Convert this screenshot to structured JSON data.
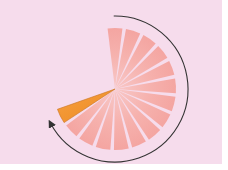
{
  "diagram": {
    "center": [
      115,
      89
    ],
    "wedge_radius": 61,
    "inner_radius": 0,
    "wedge_count": 15,
    "start_angle_deg": -97,
    "step_deg": 17.4,
    "wedge_width_deg": 14,
    "highlight_index": 14,
    "colors": {
      "background": "#f6dcec",
      "wedge": "#f5a9a6",
      "wedge_center": "#f7c4c4",
      "highlight": "#f0922e",
      "highlight_edge": "#c9721c",
      "arrow": "#333333"
    },
    "arrow": {
      "radius": 73,
      "start_angle_deg": -91,
      "end_angle_deg": 152,
      "direction": "clockwise"
    }
  }
}
